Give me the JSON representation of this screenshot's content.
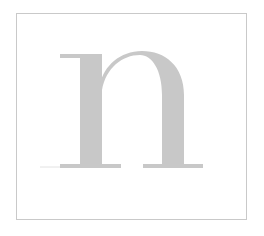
{
  "specimen": {
    "letter": "n",
    "glyph_color": "#c8c8c8",
    "frame_color": "#c9c9c9",
    "background_color": "#ffffff"
  }
}
